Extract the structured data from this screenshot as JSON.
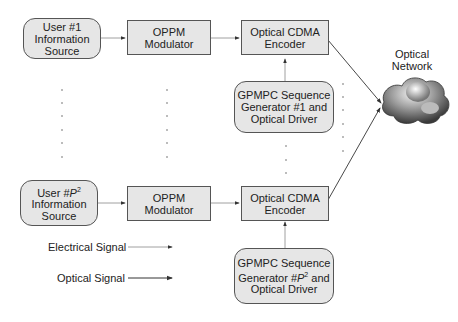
{
  "diagram": {
    "user_first": {
      "line1": "User #1",
      "line2": "Information",
      "line3": "Source"
    },
    "user_last": {
      "line1_prefix": "User #",
      "line1_var": "P",
      "line1_sup": "2",
      "line2": "Information",
      "line3": "Source"
    },
    "modulator": {
      "line1": "OPPM",
      "line2": "Modulator"
    },
    "encoder": {
      "line1": "Optical CDMA",
      "line2": "Encoder"
    },
    "generator_first": {
      "line1": "GPMPC Sequence",
      "line2": "Generator #1 and",
      "line3": "Optical Driver"
    },
    "generator_last": {
      "line1": "GPMPC Sequence",
      "line2_prefix": "Generator #",
      "line2_var": "P",
      "line2_sup": "2",
      "line2_suffix": " and",
      "line3": "Optical Driver"
    },
    "network": {
      "line1": "Optical",
      "line2": "Network"
    },
    "legend": {
      "electrical": "Electrical Signal",
      "optical": "Optical Signal"
    }
  }
}
